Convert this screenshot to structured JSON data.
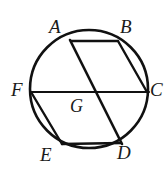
{
  "figure": {
    "type": "circle-with-inscribed-hexagon-and-chords",
    "title": "",
    "stroke_color": "#111111",
    "background_color": "#ffffff",
    "circle": {
      "center_x": 89,
      "center_y": 89,
      "radius": 59,
      "stroke_width": 2.6
    },
    "labels": [
      {
        "id": "A",
        "text": "A",
        "x": 49,
        "y": 17
      },
      {
        "id": "B",
        "text": "B",
        "x": 120,
        "y": 17
      },
      {
        "id": "C",
        "text": "C",
        "x": 150,
        "y": 80
      },
      {
        "id": "D",
        "text": "D",
        "x": 117,
        "y": 143
      },
      {
        "id": "E",
        "text": "E",
        "x": 40,
        "y": 145
      },
      {
        "id": "F",
        "text": "F",
        "x": 11,
        "y": 80
      },
      {
        "id": "G",
        "text": "G",
        "x": 70,
        "y": 97
      }
    ],
    "points": [
      {
        "id": "A",
        "x": 71,
        "y": 41
      },
      {
        "id": "B",
        "x": 118,
        "y": 41
      },
      {
        "id": "C",
        "x": 147,
        "y": 92
      },
      {
        "id": "D",
        "x": 121,
        "y": 143
      },
      {
        "id": "E",
        "x": 62,
        "y": 144
      },
      {
        "id": "F",
        "x": 31,
        "y": 92
      },
      {
        "id": "G",
        "x": 90,
        "y": 92
      }
    ],
    "segments": [
      {
        "id": "AB",
        "from": "A",
        "to": "B",
        "stroke_width": 2.4
      },
      {
        "id": "BC",
        "from": "B",
        "to": "C",
        "stroke_width": 2.4
      },
      {
        "id": "ED",
        "from": "E",
        "to": "D",
        "stroke_width": 2.4
      },
      {
        "id": "FE",
        "from": "F",
        "to": "E",
        "stroke_width": 2.4
      },
      {
        "id": "FC",
        "from": "F",
        "to": "C",
        "stroke_width": 2.2
      },
      {
        "id": "AD",
        "from": "A",
        "to": "D",
        "stroke_width": 2.6
      }
    ],
    "intersection": {
      "id": "G",
      "of": [
        "FC",
        "AD"
      ],
      "x": 90,
      "y": 92
    }
  }
}
